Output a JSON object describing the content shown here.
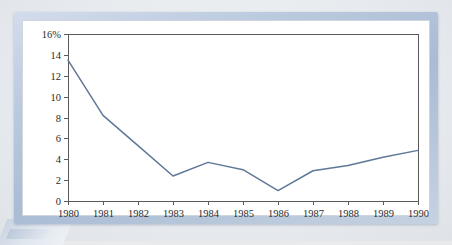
{
  "chart_data": {
    "type": "line",
    "title": "",
    "subtitle": "",
    "xlabel": "",
    "ylabel": "",
    "categories": [
      "1980",
      "1981",
      "1982",
      "1983",
      "1984",
      "1985",
      "1986",
      "1987",
      "1988",
      "1989",
      "1990"
    ],
    "x": [
      1980,
      1981,
      1982,
      1983,
      1984,
      1985,
      1986,
      1987,
      1988,
      1989,
      1990
    ],
    "series": [
      {
        "name": "",
        "values": [
          13.5,
          8.2,
          5.3,
          2.4,
          3.7,
          3.0,
          1.0,
          2.9,
          3.4,
          4.2,
          4.85
        ]
      }
    ],
    "values": [
      13.5,
      8.2,
      5.3,
      2.4,
      3.7,
      3.0,
      1.0,
      2.9,
      3.4,
      4.2,
      4.85
    ],
    "ylim": [
      0,
      16
    ],
    "xlim": [
      1980,
      1990
    ],
    "ytick_values": [
      0,
      2,
      4,
      6,
      8,
      10,
      12,
      14,
      16
    ],
    "ytick_labels": [
      "0",
      "2",
      "4",
      "6",
      "8",
      "10",
      "12",
      "14",
      "16%"
    ],
    "xtick_labels": [
      "1980",
      "1981",
      "1982",
      "1983",
      "1984",
      "1985",
      "1986",
      "1987",
      "1988",
      "1989",
      "1990"
    ],
    "grid": false,
    "legend": false,
    "legend_position": "none",
    "annotations": [],
    "line_color": "#5f7897",
    "axis_color": "#5a5a5a",
    "plot_background": "#ffffff"
  },
  "frame": {
    "border_color": "#a9bcd4",
    "panel_color": "#ffffff",
    "page_background": "#e9ecf0"
  }
}
